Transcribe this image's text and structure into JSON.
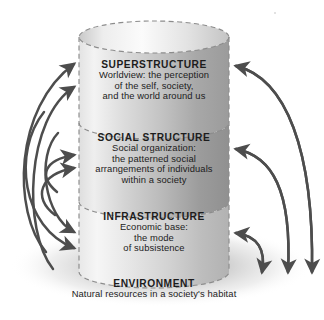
{
  "figure": {
    "type": "layered-cylinder-feedback-diagram",
    "background_color": "#ffffff",
    "ink_color": "#4a4a4a",
    "text_color": "#1c1c1c"
  },
  "tiers": [
    {
      "id": "superstructure",
      "title": "SUPERSTRUCTURE",
      "lines": [
        "Worldview: the perception",
        "of the self, society,",
        "and the world around us"
      ],
      "fill_light": "#f2f2f2",
      "fill_dark": "#9c9c9c"
    },
    {
      "id": "social-structure",
      "title": "SOCIAL STRUCTURE",
      "lines": [
        "Social organization:",
        "the patterned social",
        "arrangements of individuals",
        "within a society"
      ],
      "fill_light": "#ededed",
      "fill_dark": "#8f8f8f"
    },
    {
      "id": "infrastructure",
      "title": "INFRASTRUCTURE",
      "lines": [
        "Economic base:",
        "the mode",
        "of subsistence"
      ],
      "fill_light": "#f4f4f4",
      "fill_dark": "#a8a8a8"
    }
  ],
  "base": {
    "id": "environment",
    "title": "ENVIRONMENT",
    "lines": [
      "Natural resources in a society's habitat"
    ]
  },
  "arrows": {
    "left_group_label": "upward feedback arrows into the cylinder",
    "left_count": 6,
    "right_group_label": "downward feedback arrows from tiers to environment",
    "right_into_cylinder_count": 3,
    "right_to_environment_count": 3
  }
}
